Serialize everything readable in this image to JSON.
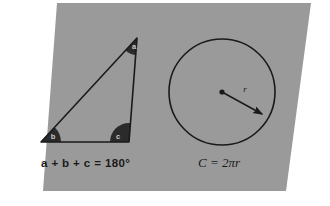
{
  "canvas": {
    "width": 330,
    "height": 206,
    "background_color": "#ffffff"
  },
  "board": {
    "name": "gray-parallelogram-board",
    "fill_color": "#9a9a9a",
    "points": "57,3 311,3 286,191 43,191"
  },
  "figures": {
    "triangle": {
      "name": "triangle-figure",
      "outline_color": "#1a1a1a",
      "stroke_width": 1.6,
      "vertices": {
        "apex": [
          137,
          38
        ],
        "bottom_left": [
          41,
          142
        ],
        "bottom_right": [
          129,
          142
        ]
      },
      "angles": [
        {
          "id": "a",
          "label": "a",
          "vertex": "apex",
          "wedge_color": "#2b2b2b",
          "label_x": 134,
          "label_y": 49
        },
        {
          "id": "b",
          "label": "b",
          "vertex": "bottom_left",
          "wedge_color": "#2b2b2b",
          "label_x": 53,
          "label_y": 139
        },
        {
          "id": "c",
          "label": "c",
          "vertex": "bottom_right",
          "wedge_color": "#2b2b2b",
          "label_x": 118,
          "label_y": 139
        }
      ],
      "formula": "a + b + c = 180°",
      "formula_x": 41,
      "formula_y": 167
    },
    "circle": {
      "name": "circle-figure",
      "outline_color": "#1a1a1a",
      "stroke_width": 1.6,
      "center": [
        222,
        92
      ],
      "radius": 53,
      "center_dot_radius": 2.6,
      "radius_arrow": {
        "name": "radius-arrow",
        "from": [
          222,
          92
        ],
        "to": [
          266,
          116
        ],
        "label": "r",
        "label_x": 245,
        "label_y": 92
      },
      "formula": "C = 2πr",
      "formula_x": 198,
      "formula_y": 167
    }
  }
}
